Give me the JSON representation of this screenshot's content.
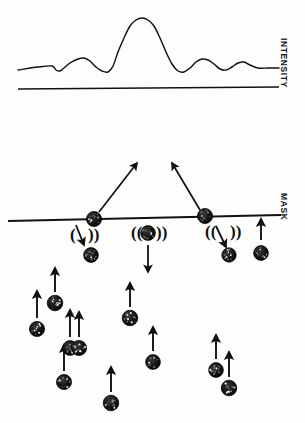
{
  "figure": {
    "title": "",
    "kind": "scattering-through-mask-diagram",
    "background_color": "#fdfdfc",
    "ink_color": "#111111"
  },
  "labels": {
    "intensity": "INTENSITY",
    "mask": "MASK"
  },
  "chart_data": {
    "type": "line",
    "title": "",
    "xlabel": "",
    "ylabel": "INTENSITY",
    "grid": false,
    "legend": null,
    "axis_line": {
      "name": "baseline-axis",
      "x_start": 18,
      "x_end": 279,
      "y_start": 89,
      "y_end": 87
    },
    "x": [
      18,
      38,
      52,
      56,
      60,
      64,
      70,
      78,
      84,
      90,
      96,
      102,
      108,
      113,
      118,
      124,
      130,
      136,
      142,
      148,
      154,
      160,
      166,
      172,
      178,
      184,
      190,
      196,
      202,
      208,
      214,
      220,
      226,
      232,
      238,
      244,
      250,
      258,
      268,
      279
    ],
    "y": [
      70,
      67,
      66,
      70,
      71,
      68,
      63,
      59,
      58,
      61,
      67,
      71,
      72,
      66,
      52,
      38,
      26,
      20,
      18,
      20,
      26,
      38,
      52,
      64,
      71,
      72,
      68,
      62,
      59,
      60,
      64,
      69,
      70,
      67,
      63,
      62,
      65,
      68,
      68,
      68
    ],
    "annotations": [
      {
        "name": "central-maximum",
        "x": 142,
        "y": 18
      },
      {
        "name": "first-order-left",
        "x": 84,
        "y": 58
      },
      {
        "name": "first-order-right",
        "x": 202,
        "y": 59
      },
      {
        "name": "second-order-right",
        "x": 244,
        "y": 62
      }
    ],
    "ylim": [
      0,
      100
    ]
  },
  "mask": {
    "name": "mask-surface",
    "line": {
      "x_start": 8,
      "x_end": 281,
      "y_start": 221,
      "y_end": 215
    },
    "particles_on_mask": [
      {
        "id": "site-left",
        "cx": 94,
        "cy": 219,
        "r": 7.6
      },
      {
        "id": "site-center",
        "cx": 148,
        "cy": 233,
        "r": 7.4
      },
      {
        "id": "site-right",
        "cx": 205,
        "cy": 216,
        "r": 7.6
      }
    ],
    "scatter_arrows": [
      {
        "name": "scatter-arrow-left-up",
        "x1": 99,
        "y1": 212,
        "x2": 137,
        "y2": 163
      },
      {
        "name": "scatter-arrow-right-up",
        "x1": 200,
        "y1": 210,
        "x2": 172,
        "y2": 163
      }
    ],
    "wave_groups": [
      {
        "name": "wave-left",
        "cx": 80,
        "cy": 236,
        "left_glyph": "(",
        "right_glyph": "))"
      },
      {
        "name": "wave-center",
        "cx": 148,
        "cy": 234,
        "left_glyph": "((",
        "right_glyph": "))"
      },
      {
        "name": "wave-right",
        "cx": 222,
        "cy": 233,
        "left_glyph": "((",
        "right_glyph": "))"
      }
    ],
    "desorb_arrows": [
      {
        "name": "desorb-arrow-left",
        "x1": 76,
        "y1": 225,
        "x2": 84,
        "y2": 245
      },
      {
        "name": "desorb-arrow-center",
        "x1": 148,
        "y1": 245,
        "x2": 148,
        "y2": 272
      },
      {
        "name": "desorb-arrow-right",
        "x1": 216,
        "y1": 226,
        "x2": 226,
        "y2": 247
      }
    ],
    "ejected_particles": [
      {
        "id": "eject-left",
        "cx": 91,
        "cy": 255,
        "r": 7.4
      },
      {
        "id": "eject-right",
        "cx": 229,
        "cy": 255,
        "r": 7.2
      },
      {
        "id": "eject-far",
        "cx": 261,
        "cy": 253,
        "r": 7.4
      }
    ],
    "incoming_arrow": {
      "name": "incoming-arrow-right",
      "x1": 261,
      "y1": 240,
      "x2": 261,
      "y2": 219
    }
  },
  "beam": {
    "name": "incident-particle-beam",
    "direction": "upward",
    "particles": [
      {
        "id": "p1",
        "cx": 37,
        "cy": 329,
        "r": 7.6,
        "arrow": {
          "x1": 37,
          "y1": 318,
          "x2": 37,
          "y2": 291
        }
      },
      {
        "id": "p2",
        "cx": 55,
        "cy": 303,
        "r": 7.8,
        "arrow": {
          "x1": 55,
          "y1": 292,
          "x2": 55,
          "y2": 268
        }
      },
      {
        "id": "p3",
        "cx": 70,
        "cy": 348,
        "r": 7.4,
        "arrow": {
          "x1": 70,
          "y1": 337,
          "x2": 70,
          "y2": 310
        }
      },
      {
        "id": "p4",
        "cx": 80,
        "cy": 348,
        "r": 0,
        "arrow": null
      },
      {
        "id": "p5",
        "cx": 81,
        "cy": 348,
        "r": 0,
        "arrow": null
      },
      {
        "id": "p6",
        "cx": 79,
        "cy": 348,
        "r": 0,
        "arrow": null
      },
      {
        "id": "p7",
        "cx": 64,
        "cy": 382,
        "r": 7.6,
        "arrow": {
          "x1": 64,
          "y1": 371,
          "x2": 64,
          "y2": 345
        }
      },
      {
        "id": "p8",
        "cx": 79,
        "cy": 348,
        "r": 7.6,
        "arrow": {
          "x1": 79,
          "y1": 337,
          "x2": 79,
          "y2": 312
        }
      },
      {
        "id": "p9",
        "cx": 130,
        "cy": 318,
        "r": 7.8,
        "arrow": {
          "x1": 130,
          "y1": 307,
          "x2": 130,
          "y2": 283
        }
      },
      {
        "id": "p10",
        "cx": 153,
        "cy": 362,
        "r": 7.4,
        "arrow": {
          "x1": 153,
          "y1": 351,
          "x2": 153,
          "y2": 327
        }
      },
      {
        "id": "p11",
        "cx": 111,
        "cy": 403,
        "r": 7.8,
        "arrow": {
          "x1": 111,
          "y1": 392,
          "x2": 111,
          "y2": 367
        }
      },
      {
        "id": "p12",
        "cx": 216,
        "cy": 370,
        "r": 7.4,
        "arrow": {
          "x1": 216,
          "y1": 359,
          "x2": 216,
          "y2": 335
        }
      },
      {
        "id": "p13",
        "cx": 229,
        "cy": 388,
        "r": 7.8,
        "arrow": {
          "x1": 229,
          "y1": 377,
          "x2": 229,
          "y2": 352
        }
      }
    ]
  }
}
